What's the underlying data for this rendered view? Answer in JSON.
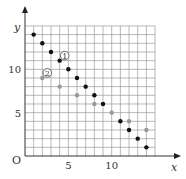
{
  "chart_data": {
    "type": "scatter",
    "title": "",
    "xlabel": "x",
    "ylabel": "y",
    "origin_label": "O",
    "xlim": [
      0,
      15
    ],
    "ylim": [
      0,
      15
    ],
    "grid": true,
    "x_ticks": [
      {
        "value": 5,
        "label": "5"
      },
      {
        "value": 10,
        "label": "10"
      }
    ],
    "y_ticks": [
      {
        "value": 5,
        "label": "5"
      },
      {
        "value": 10,
        "label": "10"
      }
    ],
    "series": [
      {
        "name": "①",
        "color": "#111111",
        "points": [
          [
            1,
            14
          ],
          [
            2,
            13
          ],
          [
            3,
            12
          ],
          [
            4,
            11
          ],
          [
            5,
            10
          ],
          [
            6,
            9
          ],
          [
            7,
            8
          ],
          [
            8,
            7
          ],
          [
            9,
            6
          ],
          [
            11,
            4
          ],
          [
            12,
            3
          ],
          [
            13,
            2
          ],
          [
            14,
            1
          ]
        ],
        "label_anchor": [
          4,
          11
        ]
      },
      {
        "name": "②",
        "color": "#999999",
        "points": [
          [
            2,
            9
          ],
          [
            4,
            8
          ],
          [
            6,
            7
          ],
          [
            8,
            6
          ],
          [
            10,
            5
          ],
          [
            12,
            4
          ],
          [
            14,
            3
          ]
        ],
        "label_anchor": [
          2,
          9
        ]
      }
    ]
  }
}
